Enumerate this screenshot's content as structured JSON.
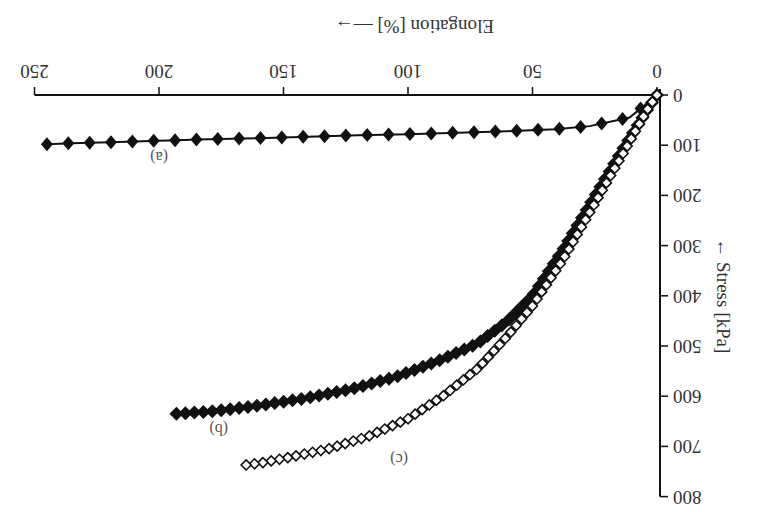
{
  "chart_data": {
    "type": "scatter",
    "orientation_note": "figure rendered rotated 180 degrees",
    "title": "",
    "xlabel": "Elongation [%]",
    "ylabel": "Stress [kPa]",
    "xlim": [
      0,
      250
    ],
    "ylim": [
      0,
      800
    ],
    "xticks": [
      "0",
      "50",
      "100",
      "150",
      "200",
      "250"
    ],
    "yticks": [
      "0",
      "100",
      "200",
      "300",
      "400",
      "500",
      "600",
      "700",
      "800"
    ],
    "grid": false,
    "legend": "inline curve labels",
    "series": [
      {
        "name": "(a)",
        "marker": "filled-diamond",
        "x": [
          0,
          11,
          27,
          41,
          60,
          80,
          100,
          120,
          140,
          160,
          180,
          200,
          220,
          235,
          245
        ],
        "y": [
          0,
          45,
          62,
          68,
          72,
          75,
          78,
          80,
          83,
          86,
          88,
          91,
          94,
          96,
          98
        ]
      },
      {
        "name": "(b)",
        "marker": "filled-square",
        "x": [
          0,
          4,
          14,
          26,
          38,
          50,
          60,
          72,
          88,
          104,
          122,
          142,
          162,
          178,
          193
        ],
        "y": [
          0,
          30,
          110,
          210,
          310,
          400,
          450,
          495,
          530,
          560,
          585,
          605,
          620,
          630,
          635
        ]
      },
      {
        "name": "(c)",
        "marker": "open-diamond",
        "x": [
          0,
          4,
          14,
          26,
          38,
          50,
          60,
          72,
          86,
          100,
          116,
          132,
          148,
          158,
          165
        ],
        "y": [
          0,
          30,
          120,
          225,
          330,
          420,
          480,
          545,
          600,
          645,
          680,
          705,
          722,
          732,
          737
        ]
      }
    ]
  },
  "axes": {
    "x_title": "Elongation [%]",
    "x_arrow": "→",
    "y_title": "Stress [kPa]",
    "x_ticks": [
      "0",
      "50",
      "100",
      "150",
      "200",
      "250"
    ],
    "y_ticks": [
      "0",
      "100",
      "200",
      "300",
      "400",
      "500",
      "600",
      "700",
      "800"
    ]
  },
  "labels": {
    "a": "(a)",
    "b": "(b)",
    "c": "(c)"
  },
  "colors": {
    "ink": "#111111",
    "text": "#333333"
  }
}
